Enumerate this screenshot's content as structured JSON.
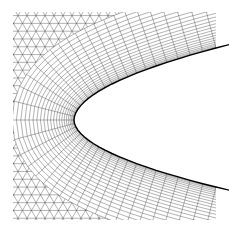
{
  "figure": {
    "background": "#ffffff",
    "line_color": "#222222",
    "bounds": {
      "x0": 13,
      "y0": 12,
      "x1": 216,
      "y1": 220
    },
    "airfoil": {
      "leading_edge": {
        "x": 74,
        "y": 120
      },
      "upper_end": {
        "x": 216,
        "y": 48
      },
      "lower_end": {
        "x": 216,
        "y": 187
      },
      "fill": "#ffffff"
    },
    "structured_layers": 22,
    "structured_thickness": 62,
    "surface_divisions": 46,
    "triangle_size": 9
  }
}
